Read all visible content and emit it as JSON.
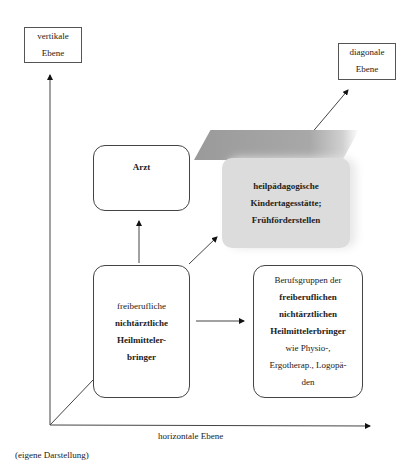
{
  "axes": {
    "vertical_label": [
      "vertikale",
      "Ebene"
    ],
    "horizontal_label": "horizontale Ebene",
    "diagonal_label": [
      "diagonale",
      "Ebene"
    ]
  },
  "boxes": {
    "arzt": {
      "lines": [
        "Arzt"
      ]
    },
    "heilpaedagogisch": {
      "lines": [
        "heilpädagogische",
        "Kindertagesstätte;",
        "Frühförderstellen"
      ]
    },
    "center": {
      "lines": [
        "freiberufliche",
        "nichtärztliche",
        "Heilmitteler-",
        "bringer"
      ]
    },
    "berufsgruppen": {
      "lines": [
        "Berufsgruppen der",
        "freiberuflichen",
        "nichtärztlichen",
        "Heilmittelerbringer",
        "wie Physio-,",
        "Ergotherap., Logopä-",
        "den"
      ]
    }
  },
  "caption": "(eigene Darstellung)"
}
